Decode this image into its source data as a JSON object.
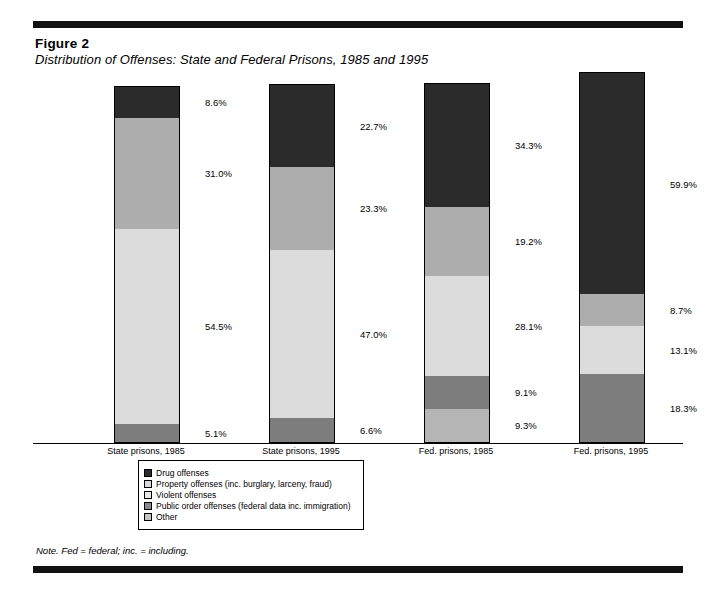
{
  "figure": {
    "number": "Figure 2",
    "title": "Distribution of Offenses: State and Federal Prisons, 1985 and 1995"
  },
  "note": "Note.   Fed = federal; inc. = including.",
  "legend": {
    "items": [
      {
        "label": "Drug offenses",
        "color": "#2b2b2b"
      },
      {
        "label": "Property offenses (inc. burglary, larceny, fraud)",
        "color": "#d9d9d9"
      },
      {
        "label": "Violent offenses",
        "color": "#e8e8e8"
      },
      {
        "label": "Public order offenses (federal data inc. immigration)",
        "color": "#8a8a8a"
      },
      {
        "label": "Other",
        "color": "#c4c4c4"
      }
    ]
  },
  "chart_data": {
    "type": "bar",
    "subtype": "stacked-100-percent",
    "title": "Distribution of Offenses: State and Federal Prisons, 1985 and 1995",
    "xlabel": "",
    "ylabel": "",
    "ylim": [
      0,
      100
    ],
    "grid": false,
    "legend_position": "bottom-center",
    "categories": [
      "State prisons, 1985",
      "State prisons, 1995",
      "Fed. prisons, 1985",
      "Fed. prisons, 1995"
    ],
    "series": [
      {
        "name": "Drug offenses",
        "color": "#2b2b2b",
        "values": [
          8.6,
          22.7,
          34.3,
          59.9
        ]
      },
      {
        "name": "Property offenses (inc. burglary, larceny, fraud)",
        "color": "#adadad",
        "values": [
          31.0,
          23.3,
          19.2,
          8.7
        ]
      },
      {
        "name": "Violent offenses",
        "color": "#dcdcdc",
        "values": [
          54.5,
          47.0,
          28.1,
          13.1
        ]
      },
      {
        "name": "Public order offenses (federal data inc. immigration)",
        "color": "#7d7d7d",
        "values": [
          5.1,
          6.6,
          9.1,
          18.3
        ]
      },
      {
        "name": "Other",
        "color": "#b5b5b5",
        "values": [
          null,
          null,
          9.3,
          null
        ]
      }
    ],
    "bars": [
      {
        "category": "State prisons, 1985",
        "segments": [
          {
            "name": "Drug offenses",
            "value": 8.6,
            "label": "8.6%",
            "color": "#2b2b2b"
          },
          {
            "name": "Property offenses (inc. burglary, larceny, fraud)",
            "value": 31.0,
            "label": "31.0%",
            "color": "#adadad"
          },
          {
            "name": "Violent offenses",
            "value": 54.5,
            "label": "54.5%",
            "color": "#dcdcdc"
          },
          {
            "name": "Public order offenses (federal data inc. immigration)",
            "value": 5.1,
            "label": "5.1%",
            "color": "#7d7d7d"
          }
        ]
      },
      {
        "category": "State prisons, 1995",
        "segments": [
          {
            "name": "Drug offenses",
            "value": 22.7,
            "label": "22.7%",
            "color": "#2b2b2b"
          },
          {
            "name": "Property offenses (inc. burglary, larceny, fraud)",
            "value": 23.3,
            "label": "23.3%",
            "color": "#adadad"
          },
          {
            "name": "Violent offenses",
            "value": 47.0,
            "label": "47.0%",
            "color": "#dcdcdc"
          },
          {
            "name": "Public order offenses (federal data inc. immigration)",
            "value": 6.6,
            "label": "6.6%",
            "color": "#7d7d7d"
          }
        ]
      },
      {
        "category": "Fed. prisons, 1985",
        "segments": [
          {
            "name": "Drug offenses",
            "value": 34.3,
            "label": "34.3%",
            "color": "#2b2b2b"
          },
          {
            "name": "Property offenses (inc. burglary, larceny, fraud)",
            "value": 19.2,
            "label": "19.2%",
            "color": "#adadad"
          },
          {
            "name": "Violent offenses",
            "value": 28.1,
            "label": "28.1%",
            "color": "#dcdcdc"
          },
          {
            "name": "Public order offenses (federal data inc. immigration)",
            "value": 9.1,
            "label": "9.1%",
            "color": "#7d7d7d"
          },
          {
            "name": "Other",
            "value": 9.3,
            "label": "9.3%",
            "color": "#b5b5b5"
          }
        ]
      },
      {
        "category": "Fed. prisons, 1995",
        "segments": [
          {
            "name": "Drug offenses",
            "value": 59.9,
            "label": "59.9%",
            "color": "#2b2b2b"
          },
          {
            "name": "Property offenses (inc. burglary, larceny, fraud)",
            "value": 8.7,
            "label": "8.7%",
            "color": "#adadad"
          },
          {
            "name": "Violent offenses",
            "value": 13.1,
            "label": "13.1%",
            "color": "#dcdcdc"
          },
          {
            "name": "Public order offenses (federal data inc. immigration)",
            "value": 18.3,
            "label": "18.3%",
            "color": "#7d7d7d"
          }
        ]
      }
    ]
  }
}
